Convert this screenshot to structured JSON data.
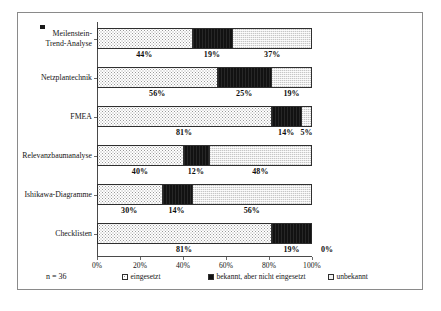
{
  "figure": {
    "sample_size_label": "n = 36"
  },
  "chart_data": {
    "type": "bar",
    "orientation": "horizontal",
    "stacked": true,
    "normalized_percent": true,
    "title": "",
    "xlabel": "",
    "ylabel": "",
    "xlim": [
      0,
      100
    ],
    "xticks": [
      0,
      20,
      40,
      60,
      80,
      100
    ],
    "xticklabels": [
      "0%",
      "20%",
      "40%",
      "60%",
      "80%",
      "100%"
    ],
    "grid": false,
    "legend_position": "bottom",
    "categories": [
      "Meilenstein-Trend-Analyse",
      "Netzplantechnik",
      "FMEA",
      "Relevanzbaumanalyse",
      "Ishikawa-Diagramme",
      "Checklisten"
    ],
    "category_lines": [
      [
        "Meilenstein-",
        "Trend-Analyse"
      ],
      [
        "Netzplantechnik"
      ],
      [
        "FMEA"
      ],
      [
        "Relevanzbaumanalyse"
      ],
      [
        "Ishikawa-Diagramme"
      ],
      [
        "Checklisten"
      ]
    ],
    "series": [
      {
        "name": "eingesetzt",
        "color": "#ffffff",
        "pattern": "dotted",
        "values": [
          44,
          56,
          81,
          40,
          30,
          81
        ],
        "labels": [
          "44%",
          "56%",
          "81%",
          "40%",
          "30%",
          "81%"
        ]
      },
      {
        "name": "bekannt, aber nicht eingesetzt",
        "color": "#121212",
        "pattern": "solid-black",
        "values": [
          19,
          25,
          14,
          12,
          14,
          19
        ],
        "labels": [
          "19%",
          "25%",
          "14%",
          "12%",
          "14%",
          "19%"
        ]
      },
      {
        "name": "unbekannt",
        "color": "#e9e9e9",
        "pattern": "light-hatch",
        "values": [
          37,
          19,
          5,
          48,
          56,
          0
        ],
        "labels": [
          "37%",
          "19%",
          "5%",
          "48%",
          "56%",
          "0%"
        ]
      }
    ]
  }
}
